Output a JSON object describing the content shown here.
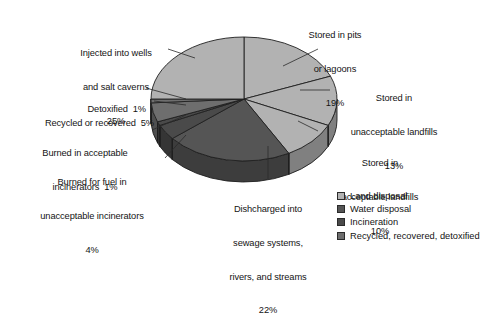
{
  "chart_data": {
    "type": "pie",
    "title": "",
    "subtitle": "",
    "xlabel": "",
    "ylabel": "",
    "three_d": true,
    "start_angle_deg": -90,
    "direction": "clockwise",
    "legend_position": "bottom-right",
    "grid": false,
    "total_percent": 100,
    "categories": [
      "Stored in pits or lagoons",
      "Stored in unacceptable landfills",
      "Stored in acceptable landfills",
      "Dishcharged into sewage systems, rivers, and streams",
      "Burned for fuel in unacceptable incinerators",
      "Burned in acceptable incinerators",
      "Recycled or recovered",
      "Detoxified",
      "Injected into wells and salt caverns"
    ],
    "values": [
      19,
      13,
      10,
      22,
      4,
      1,
      5,
      1,
      25
    ],
    "slices": [
      {
        "label": "Stored in pits or lagoons",
        "value": 19,
        "value_text": "19%",
        "group": "Land disposal",
        "color": "#b2b2b2"
      },
      {
        "label": "Stored in unacceptable landfills",
        "value": 13,
        "value_text": "13%",
        "group": "Land disposal",
        "color": "#b2b2b2"
      },
      {
        "label": "Stored in acceptable landfills",
        "value": 10,
        "value_text": "10%",
        "group": "Land disposal",
        "color": "#b2b2b2"
      },
      {
        "label": "Dishcharged into sewage systems, rivers, and streams",
        "value": 22,
        "value_text": "22%",
        "group": "Water disposal",
        "color": "#555555"
      },
      {
        "label": "Burned for fuel in unacceptable incinerators",
        "value": 4,
        "value_text": "4%",
        "group": "Incineration",
        "color": "#4a4a4a"
      },
      {
        "label": "Burned in acceptable incinerators",
        "value": 1,
        "value_text": "1%",
        "group": "Incineration",
        "color": "#4a4a4a"
      },
      {
        "label": "Recycled or recovered",
        "value": 5,
        "value_text": "5%",
        "group": "Recycled, recovered, detoxified",
        "color": "#6e6e6e"
      },
      {
        "label": "Detoxified",
        "value": 1,
        "value_text": "1%",
        "group": "Recycled, recovered, detoxified",
        "color": "#6e6e6e"
      },
      {
        "label": "Injected into wells and salt caverns",
        "value": 25,
        "value_text": "25%",
        "group": "Land disposal",
        "color": "#b2b2b2"
      }
    ],
    "legend": [
      {
        "label": "Land disposal",
        "color": "#b2b2b2"
      },
      {
        "label": "Water disposal",
        "color": "#555555"
      },
      {
        "label": "Incineration",
        "color": "#4a4a4a"
      },
      {
        "label": "Recycled, recovered, detoxified",
        "color": "#6e6e6e"
      }
    ]
  },
  "callouts": {
    "injected": {
      "l1": "Injected into wells",
      "l2": "and salt caverns",
      "l3": "25%"
    },
    "pits": {
      "l1": "Stored in pits",
      "l2": "or lagoons",
      "l3": "19%"
    },
    "unacceptable_landfills": {
      "l1": "Stored in",
      "l2": "unacceptable landfills",
      "l3": "13%"
    },
    "acceptable_landfills": {
      "l1": "Stored in",
      "l2": "acceptable landfills",
      "l3": "10%"
    },
    "sewage": {
      "l1": "Dishcharged into",
      "l2": "sewage systems,",
      "l3": "rivers, and streams",
      "l4": "22%"
    },
    "burned_fuel": {
      "l1": "Burned for fuel in",
      "l2": "unacceptable incinerators",
      "l3": "4%"
    },
    "burned_acceptable": {
      "l1": "Burned in acceptable",
      "l2": "incinerators  1%"
    },
    "recycled": {
      "l1": "Recycled or recovered  5%"
    },
    "detoxified": {
      "l1": "Detoxified  1%"
    }
  },
  "colors": {
    "land": "#b2b2b2",
    "water": "#555555",
    "incineration": "#4a4a4a",
    "recycled": "#6e6e6e",
    "outline": "#1f1f1f",
    "background": "#ffffff",
    "leader": "#2b2b2b"
  }
}
